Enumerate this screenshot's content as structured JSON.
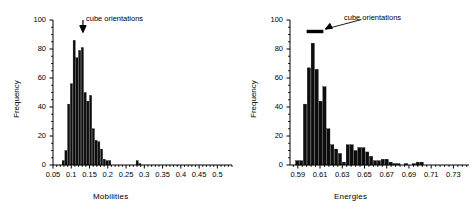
{
  "figure": {
    "background": "#ffffff",
    "ink_color": "#000000",
    "bar_color": "#0d0d0d"
  },
  "panels": [
    {
      "id": "mobilities",
      "annotation_label": "cube orientations",
      "annotation_marker": "down-arrow"
    },
    {
      "id": "energies",
      "annotation_label": "cube orientations",
      "annotation_marker": "horizontal-bar-with-arrow"
    }
  ],
  "chart_data": [
    {
      "type": "bar",
      "id": "mobilities-histogram",
      "title": "",
      "xlabel": "Mobilities",
      "ylabel": "Frequency",
      "xlim": [
        0.05,
        0.54
      ],
      "ylim": [
        0,
        100
      ],
      "xticks": [
        0.05,
        0.1,
        0.15,
        0.2,
        0.25,
        0.3,
        0.35,
        0.4,
        0.45,
        0.5
      ],
      "xtick_labels": [
        "0.05",
        "0.1",
        "0.15",
        "0.2",
        "0.25",
        "0.3",
        "0.35",
        "0.4",
        "0.45",
        "0.5"
      ],
      "yticks": [
        0,
        20,
        40,
        60,
        80,
        100
      ],
      "ytick_labels": [
        "0",
        "20",
        "40",
        "60",
        "80",
        "100"
      ],
      "minor_ticks": true,
      "grid": false,
      "legend": "none",
      "bin_width": 0.0075,
      "bin_left_edges": [
        0.075,
        0.0825,
        0.09,
        0.0975,
        0.105,
        0.1125,
        0.12,
        0.1275,
        0.135,
        0.1425,
        0.15,
        0.1575,
        0.165,
        0.1725,
        0.18,
        0.1875,
        0.195,
        0.2025,
        0.21,
        0.2175,
        0.225,
        0.2775,
        0.285
      ],
      "values": [
        3,
        10,
        42,
        56,
        86,
        74,
        79,
        81,
        50,
        44,
        48,
        25,
        17,
        16,
        11,
        4,
        3,
        3,
        0,
        0,
        0,
        3,
        1
      ],
      "annotations": [
        {
          "text": "cube orientations",
          "points_to_x": 0.132,
          "points_to_y": 92
        }
      ]
    },
    {
      "type": "bar",
      "id": "energies-histogram",
      "title": "",
      "xlabel": "Energies",
      "ylabel": "Frequency",
      "xlim": [
        0.583,
        0.744
      ],
      "ylim": [
        0,
        100
      ],
      "xticks": [
        0.59,
        0.61,
        0.63,
        0.65,
        0.67,
        0.69,
        0.71,
        0.73
      ],
      "xtick_labels": [
        "0.59",
        "0.61",
        "0.63",
        "0.65",
        "0.67",
        "0.69",
        "0.71",
        "0.73"
      ],
      "yticks": [
        0,
        20,
        40,
        60,
        80,
        100
      ],
      "ytick_labels": [
        "0",
        "20",
        "40",
        "60",
        "80",
        "100"
      ],
      "minor_ticks": true,
      "grid": false,
      "legend": "none",
      "bin_width": 0.0035,
      "bin_left_edges": [
        0.588,
        0.5915,
        0.595,
        0.5985,
        0.602,
        0.6055,
        0.609,
        0.6125,
        0.616,
        0.6195,
        0.623,
        0.6265,
        0.63,
        0.6335,
        0.637,
        0.6405,
        0.644,
        0.6475,
        0.651,
        0.6545,
        0.658,
        0.6615,
        0.665,
        0.6685,
        0.672,
        0.6755,
        0.679,
        0.6825,
        0.686,
        0.6895,
        0.693,
        0.6965,
        0.7,
        0.707,
        0.7175,
        0.721
      ],
      "values": [
        3,
        3,
        42,
        67,
        84,
        66,
        44,
        54,
        25,
        14,
        11,
        8,
        2,
        14,
        14,
        10,
        12,
        12,
        9,
        6,
        3,
        3,
        4,
        4,
        2,
        1,
        1,
        0,
        1,
        0,
        1,
        2,
        2,
        0,
        0,
        0
      ],
      "annotations": [
        {
          "text": "cube orientations",
          "bar_x_start": 0.598,
          "bar_x_end": 0.613,
          "bar_y": 92
        }
      ]
    }
  ]
}
